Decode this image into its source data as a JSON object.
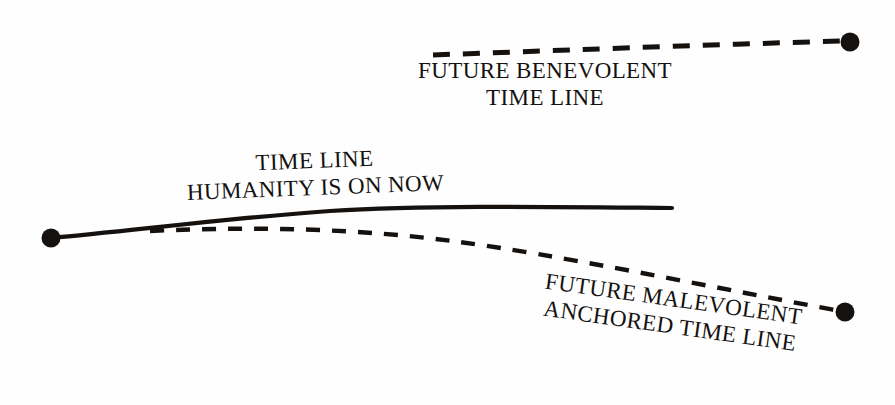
{
  "diagram": {
    "background_color": "#fefefe",
    "ink_color": "#14110f",
    "labels": {
      "benevolent": {
        "line1": "FUTURE BENEVOLENT",
        "line2": "TIME LINE"
      },
      "current": {
        "line1": "TIME LINE",
        "line2": "HUMANITY IS ON NOW"
      },
      "malevolent": {
        "line1": "FUTURE MALEVOLENT",
        "line2": "ANCHORED TIME LINE"
      }
    },
    "paths": {
      "current_timeline": {
        "style": "solid",
        "stroke_width": 4.2,
        "d": "M 51 238 C 130 231, 230 218, 330 211 C 430 205, 560 207, 672 208"
      },
      "benevolent_timeline": {
        "style": "dashed",
        "stroke_width": 5,
        "dash_array": "17 13",
        "d": "M 433 55 C 540 51, 700 45, 843 41"
      },
      "malevolent_timeline": {
        "style": "dashed",
        "stroke_width": 4.4,
        "dash_array": "14 12",
        "d": "M 150 231 C 260 226, 360 229, 452 241 C 560 255, 700 285, 840 311"
      }
    },
    "nodes": {
      "origin": {
        "cx": 51,
        "cy": 238,
        "r": 9.5
      },
      "benevolent_end": {
        "cx": 850,
        "cy": 42,
        "r": 9.5
      },
      "malevolent_end": {
        "cx": 845,
        "cy": 312,
        "r": 9.5
      }
    }
  }
}
